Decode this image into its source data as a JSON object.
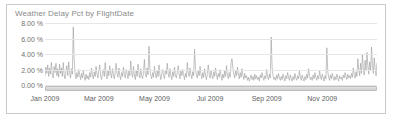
{
  "panel": {
    "title": "Weather Delay Pct by FlightDate",
    "border_color": "#c9c9c9",
    "background_color": "#ffffff"
  },
  "chart_data": {
    "type": "line",
    "title": "Weather Delay Pct by FlightDate",
    "xlabel": "",
    "ylabel": "",
    "ylim": [
      0,
      8
    ],
    "ytick_labels": [
      "0.00 %",
      "2.00 %",
      "4.00 %",
      "6.00 %",
      "8.00 %"
    ],
    "ytick_values": [
      0,
      2,
      4,
      6,
      8
    ],
    "xtick_labels": [
      "Jan 2009",
      "Mar 2009",
      "May 2009",
      "Jul 2009",
      "Sep 2009",
      "Nov 2009"
    ],
    "xtick_positions": [
      0,
      59,
      120,
      181,
      243,
      304
    ],
    "grid": true,
    "legend": "none",
    "line_color": "#9a9a9a",
    "series": [
      {
        "name": "Weather Delay Pct",
        "values": [
          1.2,
          2.3,
          1.5,
          2.6,
          1.1,
          2.2,
          1.4,
          2.9,
          1.3,
          0.9,
          2.4,
          1.6,
          2.8,
          1.2,
          2.1,
          1.0,
          2.7,
          1.5,
          2.2,
          1.1,
          2.9,
          1.3,
          0.8,
          1.9,
          2.5,
          1.2,
          3.0,
          1.6,
          0.9,
          2.1,
          1.4,
          7.5,
          3.2,
          1.5,
          0.8,
          1.6,
          1.0,
          2.0,
          1.3,
          0.7,
          1.5,
          0.9,
          1.8,
          1.1,
          0.6,
          1.4,
          0.8,
          1.2,
          0.7,
          1.6,
          1.0,
          2.2,
          1.3,
          0.8,
          1.7,
          1.1,
          2.4,
          1.4,
          0.9,
          1.8,
          2.6,
          1.2,
          0.7,
          1.5,
          2.0,
          1.1,
          2.9,
          1.4,
          0.8,
          1.9,
          1.2,
          2.5,
          1.5,
          0.9,
          2.1,
          1.3,
          0.8,
          1.7,
          2.8,
          1.4,
          1.0,
          2.2,
          1.2,
          0.7,
          1.6,
          1.1,
          2.3,
          1.3,
          0.9,
          2.0,
          1.5,
          0.8,
          1.8,
          1.2,
          3.1,
          1.6,
          1.0,
          2.4,
          1.3,
          0.7,
          1.9,
          1.1,
          2.7,
          1.5,
          0.9,
          2.1,
          1.2,
          0.8,
          1.7,
          3.3,
          1.4,
          1.0,
          2.2,
          1.3,
          5.0,
          2.1,
          1.2,
          0.8,
          1.6,
          1.0,
          2.4,
          1.4,
          0.9,
          1.8,
          1.1,
          2.6,
          1.3,
          0.7,
          1.5,
          2.0,
          1.2,
          0.8,
          1.9,
          1.4,
          2.8,
          1.5,
          1.0,
          2.1,
          1.2,
          0.7,
          1.7,
          1.1,
          2.3,
          1.3,
          0.9,
          1.6,
          2.5,
          1.4,
          0.8,
          1.8,
          1.2,
          2.0,
          1.3,
          0.7,
          1.5,
          1.0,
          2.9,
          1.6,
          1.1,
          2.2,
          1.3,
          0.8,
          1.7,
          1.2,
          4.6,
          2.0,
          1.3,
          0.9,
          1.8,
          1.2,
          2.4,
          1.4,
          0.8,
          1.6,
          1.0,
          2.1,
          1.3,
          0.7,
          1.5,
          2.6,
          1.4,
          0.9,
          1.9,
          1.2,
          0.8,
          1.7,
          1.1,
          2.2,
          1.3,
          0.7,
          1.5,
          1.0,
          2.0,
          1.2,
          0.6,
          1.4,
          0.9,
          1.8,
          1.1,
          2.5,
          1.3,
          0.8,
          1.6,
          1.0,
          2.9,
          3.4,
          2.2,
          1.4,
          0.9,
          1.8,
          1.2,
          2.3,
          1.4,
          0.8,
          1.6,
          1.0,
          2.1,
          1.3,
          0.7,
          1.5,
          0.9,
          1.2,
          0.6,
          1.0,
          0.5,
          0.9,
          1.3,
          0.7,
          1.1,
          0.6,
          1.4,
          0.8,
          1.2,
          0.7,
          1.0,
          0.5,
          1.3,
          0.9,
          1.6,
          1.0,
          0.6,
          1.2,
          0.8,
          2.0,
          1.1,
          0.7,
          1.4,
          0.9,
          6.2,
          2.3,
          1.2,
          0.7,
          1.0,
          0.6,
          1.3,
          0.8,
          1.5,
          0.9,
          0.6,
          1.1,
          0.7,
          1.4,
          0.9,
          0.5,
          1.2,
          0.8,
          1.6,
          1.0,
          0.6,
          1.3,
          0.8,
          0.5,
          1.1,
          0.7,
          1.5,
          0.9,
          0.6,
          1.2,
          0.8,
          1.8,
          1.0,
          0.6,
          1.3,
          0.8,
          0.5,
          1.1,
          0.7,
          1.4,
          0.9,
          2.1,
          1.2,
          0.7,
          1.0,
          0.6,
          1.3,
          0.8,
          1.6,
          1.0,
          0.6,
          1.2,
          0.8,
          1.9,
          1.1,
          0.7,
          1.4,
          0.9,
          0.5,
          1.2,
          0.8,
          4.8,
          1.8,
          1.0,
          0.6,
          1.3,
          0.8,
          1.5,
          0.9,
          0.6,
          1.1,
          0.7,
          1.4,
          0.9,
          0.5,
          1.2,
          0.8,
          1.0,
          0.6,
          1.3,
          0.9,
          1.6,
          1.1,
          0.7,
          1.4,
          0.9,
          1.2,
          0.8,
          1.5,
          1.0,
          2.2,
          1.3,
          0.9,
          1.7,
          1.1,
          3.4,
          2.0,
          1.2,
          2.8,
          1.5,
          3.9,
          2.1,
          1.3,
          3.2,
          1.8,
          4.2,
          2.4,
          1.4,
          3.0,
          1.9,
          4.9,
          2.6,
          1.5,
          3.5,
          2.0,
          1.2,
          2.8
        ]
      }
    ]
  },
  "controls": {
    "range_slider_name": "horizontal-range-slider"
  }
}
